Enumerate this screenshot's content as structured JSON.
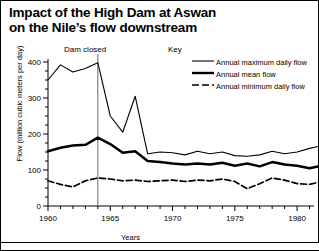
{
  "title": {
    "line1": "Impact of the High Dam at Aswan",
    "line2": "on the Nile’s flow downstream"
  },
  "annotations": {
    "dam_closed": "Dam closed",
    "key_title": "Key"
  },
  "chart_data": {
    "type": "line",
    "title": "Impact of the High Dam at Aswan on the Nile’s flow downstream",
    "xlabel": "Years",
    "ylabel": "Flow (million cubic meters per day)",
    "xlim": [
      1959.5,
      1982.5
    ],
    "ylim": [
      0,
      400
    ],
    "yticks": [
      0,
      100,
      200,
      300,
      400
    ],
    "ytick_labels": [
      "0",
      "100",
      "200",
      "300",
      "400"
    ],
    "yminor_step": 25,
    "xticks": [
      1960,
      1965,
      1970,
      1975,
      1980
    ],
    "xtick_labels": [
      "1960",
      "1965",
      "1970",
      "1975",
      "1980"
    ],
    "xminor_step": 1,
    "grid": false,
    "legend_position": "top-right",
    "x": [
      1960,
      1961,
      1962,
      1963,
      1964,
      1965,
      1966,
      1967,
      1968,
      1969,
      1970,
      1971,
      1972,
      1973,
      1974,
      1975,
      1976,
      1977,
      1978,
      1979,
      1980,
      1981,
      1982
    ],
    "series": [
      {
        "name": "Annual maximum daily flow",
        "style": "thin-solid",
        "values": [
          350,
          392,
          372,
          382,
          398,
          250,
          205,
          305,
          145,
          150,
          148,
          142,
          152,
          145,
          150,
          140,
          138,
          142,
          152,
          145,
          150,
          160,
          168
        ]
      },
      {
        "name": "Annual mean flow",
        "style": "thick-solid",
        "values": [
          152,
          162,
          168,
          170,
          190,
          172,
          148,
          152,
          125,
          122,
          118,
          115,
          118,
          115,
          120,
          112,
          118,
          110,
          122,
          115,
          112,
          105,
          112
        ]
      },
      {
        "name": "Annual minimum daily flow",
        "style": "dashed",
        "values": [
          70,
          60,
          53,
          70,
          78,
          75,
          70,
          72,
          68,
          70,
          72,
          68,
          72,
          70,
          75,
          68,
          48,
          62,
          78,
          72,
          62,
          60,
          68
        ]
      }
    ],
    "markers": [
      {
        "label": "Dam closed",
        "x": 1964,
        "type": "vertical-line"
      }
    ]
  }
}
